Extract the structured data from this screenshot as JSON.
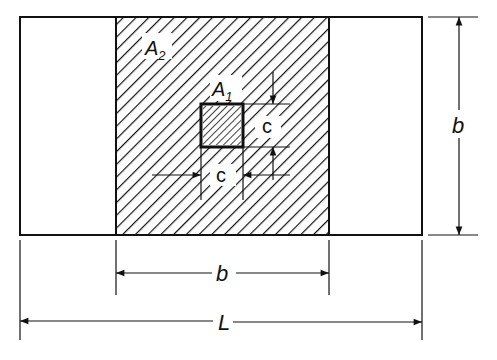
{
  "diagram": {
    "labels": {
      "A2": "A",
      "A2_sub": "2",
      "A1": "A",
      "A1_sub": "1",
      "c_vertical": "c",
      "c_horizontal": "c",
      "b_right": "b",
      "b_bottom": "b",
      "L": "L"
    },
    "colors": {
      "line": "#111111",
      "background": "#ffffff"
    }
  }
}
